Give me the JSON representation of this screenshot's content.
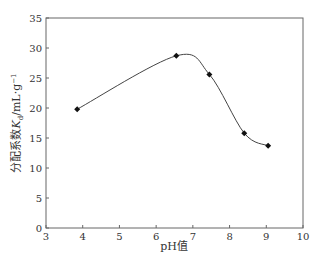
{
  "chart_data": {
    "type": "line",
    "title": "",
    "xlabel": "pH值",
    "ylabel": "分配系数K_d/mL·g⁻¹",
    "ylabel_main": "分配系数",
    "ylabel_var": "K",
    "ylabel_sub": "d",
    "ylabel_unit": "/mL·g",
    "ylabel_sup": "−1",
    "xlim": [
      3,
      10
    ],
    "ylim": [
      0,
      35
    ],
    "xticks": [
      3,
      4,
      5,
      6,
      7,
      8,
      9,
      10
    ],
    "yticks": [
      0,
      5,
      10,
      15,
      20,
      25,
      30,
      35
    ],
    "grid": false,
    "series": [
      {
        "name": "Kd",
        "x": [
          3.85,
          6.55,
          7.45,
          8.4,
          9.05
        ],
        "y": [
          19.8,
          28.7,
          25.6,
          15.8,
          13.7
        ],
        "marker": "diamond",
        "smooth": true
      }
    ]
  }
}
